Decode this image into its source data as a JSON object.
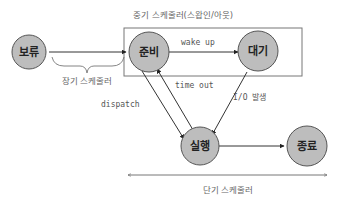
{
  "diagram": {
    "nodes": [
      {
        "id": "hold",
        "label": "보류"
      },
      {
        "id": "ready",
        "label": "준비"
      },
      {
        "id": "wait",
        "label": "대기"
      },
      {
        "id": "run",
        "label": "실행"
      },
      {
        "id": "exit",
        "label": "종료"
      }
    ],
    "edges": [
      {
        "from": "hold",
        "to": "ready",
        "label": ""
      },
      {
        "from": "ready",
        "to": "wait",
        "label": "wake up"
      },
      {
        "from": "ready",
        "to": "run",
        "label": "dispatch"
      },
      {
        "from": "run",
        "to": "ready",
        "label": "time out"
      },
      {
        "from": "wait",
        "to": "run",
        "label": "I/O 발생"
      },
      {
        "from": "run",
        "to": "exit",
        "label": ""
      }
    ],
    "schedulers": {
      "long_term": "장기 스케줄러",
      "mid_term": "중기 스케줄러(스왑인/아웃)",
      "short_term": "단기 스케줄러"
    },
    "colors": {
      "node_fill": "#bdbdbd",
      "node_stroke": "#555555",
      "line": "#333333",
      "label": "#666666"
    }
  }
}
